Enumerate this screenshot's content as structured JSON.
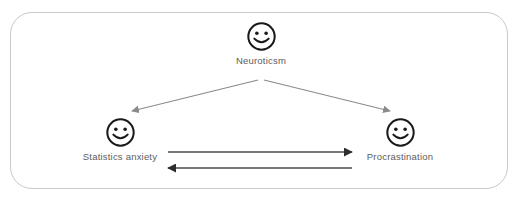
{
  "diagram": {
    "type": "path-model",
    "frame": {
      "border_color": "#c9c9c9",
      "background_color": "#ffffff"
    },
    "nodes": [
      {
        "id": "neuroticism",
        "label": "Neuroticsm",
        "icon": "smiley-face-icon",
        "position": "top-center"
      },
      {
        "id": "statistics-anxiety",
        "label": "Statistics anxiety",
        "icon": "smiley-face-icon",
        "position": "bottom-left"
      },
      {
        "id": "procrastination",
        "label": "Procrastination",
        "icon": "smiley-face-icon",
        "position": "bottom-right"
      }
    ],
    "edges": [
      {
        "id": "neuroticism-to-statistics-anxiety",
        "from": "neuroticism",
        "to": "statistics-anxiety",
        "style": "single-arrow",
        "color": "#8a8a8a"
      },
      {
        "id": "neuroticism-to-procrastination",
        "from": "neuroticism",
        "to": "procrastination",
        "style": "single-arrow",
        "color": "#8a8a8a"
      },
      {
        "id": "statistics-anxiety-to-procrastination",
        "from": "statistics-anxiety",
        "to": "procrastination",
        "style": "single-arrow",
        "color": "#4a4a4a"
      },
      {
        "id": "procrastination-to-statistics-anxiety",
        "from": "procrastination",
        "to": "statistics-anxiety",
        "style": "single-arrow",
        "color": "#4a4a4a"
      }
    ],
    "label_color": "#5d5d5d"
  }
}
